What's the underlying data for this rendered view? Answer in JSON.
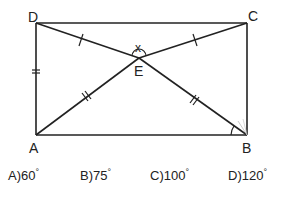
{
  "figure": {
    "points": {
      "D": {
        "label": "D",
        "x": 36,
        "y": 23
      },
      "C": {
        "label": "C",
        "x": 247,
        "y": 23
      },
      "A": {
        "label": "A",
        "x": 36,
        "y": 135
      },
      "B": {
        "label": "B",
        "x": 247,
        "y": 135
      },
      "E": {
        "label": "E",
        "x": 139,
        "y": 58
      }
    },
    "angle_label": "x",
    "tick_marks": {
      "DE": 1,
      "EC": 1,
      "DA": 2,
      "AE": 2,
      "EB": 2
    }
  },
  "options": [
    {
      "letter": "A)",
      "value": "60",
      "unit": "°"
    },
    {
      "letter": "B)",
      "value": "75",
      "unit": "°"
    },
    {
      "letter": "C)",
      "value": "100",
      "unit": "°"
    },
    {
      "letter": "D)",
      "value": "120",
      "unit": "°"
    }
  ]
}
